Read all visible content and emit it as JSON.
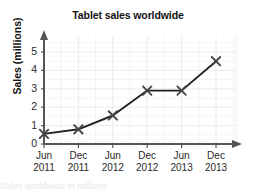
{
  "chart_data": {
    "type": "line",
    "title": "Tablet sales worldwide",
    "xlabel": "",
    "ylabel": "Sales (millions)",
    "categories": [
      "Jun 2011",
      "Dec 2011",
      "Jun 2012",
      "Dec 2012",
      "Jun 2013",
      "Dec 2013"
    ],
    "x_tick_lines": [
      {
        "month": "Jun",
        "year": "2011"
      },
      {
        "month": "Dec",
        "year": "2011"
      },
      {
        "month": "Jun",
        "year": "2012"
      },
      {
        "month": "Dec",
        "year": "2012"
      },
      {
        "month": "Jun",
        "year": "2013"
      },
      {
        "month": "Dec",
        "year": "2013"
      }
    ],
    "values": [
      0.55,
      0.8,
      1.55,
      2.9,
      2.9,
      4.5
    ],
    "y_ticks": [
      0,
      1,
      2,
      3,
      4,
      5
    ],
    "ylim": [
      0,
      5.6
    ],
    "grid": true,
    "minor_grid": true,
    "legend": "none",
    "marker": "x",
    "line_color": "#222222",
    "marker_color": "#444444",
    "grid_color": "#e9ecef",
    "axis_color": "#555555",
    "series_name": "Tablet sales"
  },
  "footer": {
    "cut_off_text": "Sales worldwide in millions"
  }
}
